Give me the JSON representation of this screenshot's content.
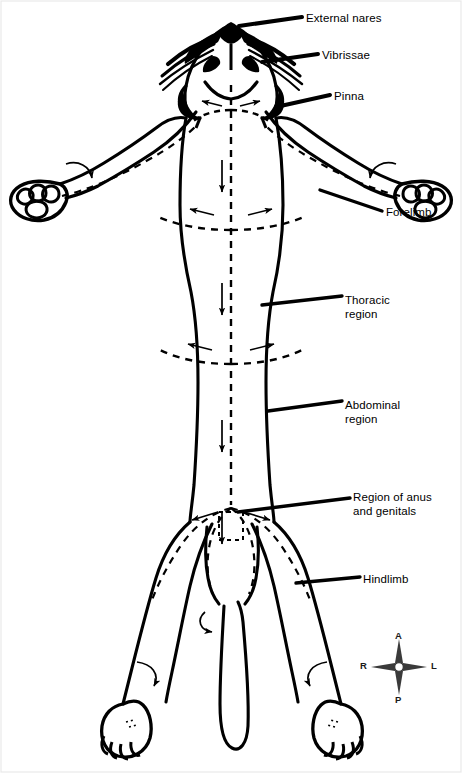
{
  "figure": {
    "orientation_key": {
      "name": "compass-rose",
      "anterior": "A",
      "posterior": "P",
      "right": "R",
      "left": "L"
    },
    "labels": [
      {
        "id": "external-nares",
        "text": "External nares",
        "x": 306,
        "y": 12
      },
      {
        "id": "vibrissae",
        "text": "Vibrissae",
        "x": 322,
        "y": 49
      },
      {
        "id": "pinna",
        "text": "Pinna",
        "x": 334,
        "y": 90
      },
      {
        "id": "forelimb",
        "text": "Forelimb",
        "x": 386,
        "y": 206
      },
      {
        "id": "thoracic-region",
        "text": "Thoracic\nregion",
        "x": 345,
        "y": 294
      },
      {
        "id": "abdominal-region",
        "text": "Abdominal\nregion",
        "x": 345,
        "y": 399
      },
      {
        "id": "region-of-anus-and-genitals",
        "text": "Region of anus\nand genitals",
        "x": 353,
        "y": 491
      },
      {
        "id": "hindlimb",
        "text": "Hindlimb",
        "x": 363,
        "y": 573
      }
    ],
    "colors": {
      "ink": "#000000",
      "background": "#ffffff"
    }
  }
}
